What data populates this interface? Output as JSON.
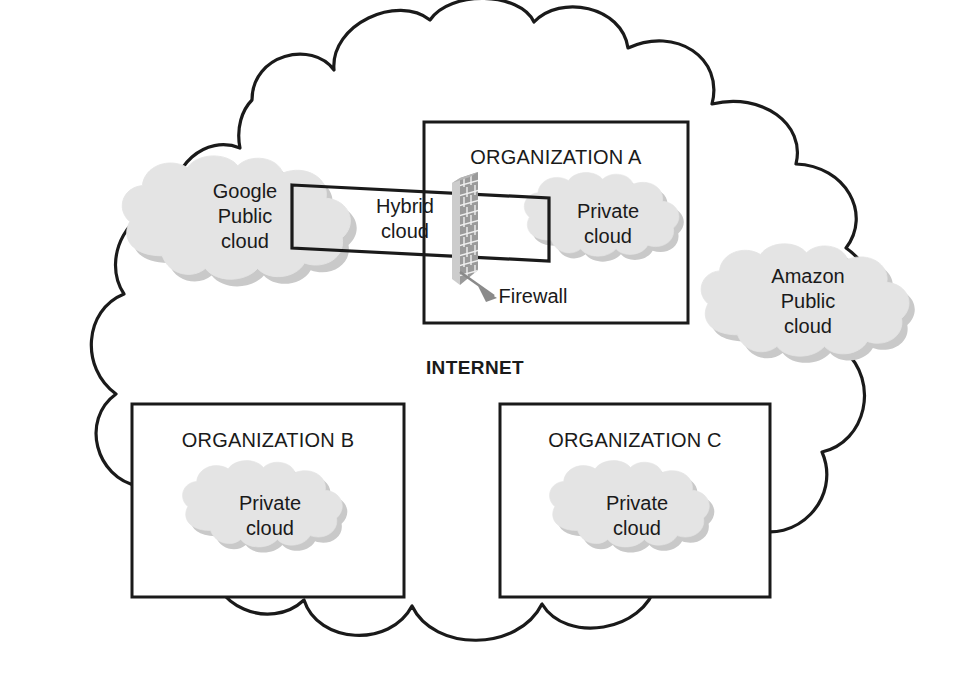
{
  "diagram": {
    "internet_label": "INTERNET",
    "colors": {
      "cloud_fill": "#e4e4e4",
      "cloud_shadow": "#c9c9c9",
      "stroke": "#1a1a1a",
      "background": "#ffffff",
      "arrow_gray": "#8a8a8a",
      "brick_dark": "#6f6f6f",
      "brick_light": "#d2d2d2"
    },
    "outer_cloud": {
      "name": "internet-cloud",
      "label": "INTERNET"
    },
    "public_clouds": [
      {
        "id": "google-public-cloud",
        "lines": [
          "Google",
          "Public",
          "cloud"
        ],
        "cx": 245,
        "cy": 213
      },
      {
        "id": "amazon-public-cloud",
        "lines": [
          "Amazon",
          "Public",
          "cloud"
        ],
        "cx": 808,
        "cy": 297
      }
    ],
    "organizations": [
      {
        "id": "organization-a",
        "label": "ORGANIZATION A",
        "label_x": 556,
        "label_y": 157,
        "box": {
          "x": 424,
          "y": 122,
          "w": 264,
          "h": 201
        },
        "private_cloud": {
          "id": "private-cloud-a",
          "lines": [
            "Private",
            "cloud"
          ],
          "cx": 605,
          "cy": 218
        }
      },
      {
        "id": "organization-b",
        "label": "ORGANIZATION B",
        "label_x": 268,
        "label_y": 440,
        "box": {
          "x": 132,
          "y": 404,
          "w": 272,
          "h": 193
        },
        "private_cloud": {
          "id": "private-cloud-b",
          "lines": [
            "Private",
            "cloud"
          ],
          "cx": 268,
          "cy": 512
        }
      },
      {
        "id": "organization-c",
        "label": "ORGANIZATION C",
        "label_x": 635,
        "label_y": 440,
        "box": {
          "x": 500,
          "y": 404,
          "w": 270,
          "h": 193
        },
        "private_cloud": {
          "id": "private-cloud-c",
          "lines": [
            "Private",
            "cloud"
          ],
          "cx": 635,
          "cy": 512
        }
      }
    ],
    "connector": {
      "id": "hybrid-cloud-connector",
      "lines": [
        "Hybrid",
        "cloud"
      ],
      "label_x": 405,
      "label_y": 215
    },
    "firewall": {
      "id": "firewall",
      "label": "Firewall",
      "label_x": 533,
      "label_y": 300
    }
  }
}
